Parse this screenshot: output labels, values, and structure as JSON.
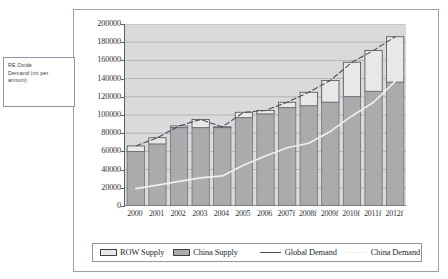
{
  "callout": {
    "name": "re-oxide-demand-label",
    "text": "RE Oxide\nDemand (mt per\nannum)"
  },
  "legend": {
    "items": [
      {
        "label": "ROW Supply",
        "marker": "swatch",
        "color": "#e8e8e8"
      },
      {
        "label": "China Supply",
        "marker": "swatch",
        "color": "#a9abad"
      },
      {
        "label": "Global Demand",
        "marker": "line",
        "color": "#4a4e52"
      },
      {
        "label": "China Demand",
        "marker": "line",
        "color": "#efefef"
      }
    ]
  },
  "chart_data": {
    "type": "bar",
    "stacked": true,
    "title": "",
    "subtitle": "",
    "xlabel": "",
    "ylabel": "RE Oxide Demand (mt per annum)",
    "ylim": [
      0,
      200000
    ],
    "ytick_step": 20000,
    "yticks": [
      200000,
      180000,
      160000,
      140000,
      120000,
      100000,
      80000,
      60000,
      40000,
      20000,
      0
    ],
    "ytick_labels": [
      "200000",
      "180000",
      "160000",
      "140000",
      "120000",
      "100000",
      "80000",
      "60000",
      "40000",
      "20000",
      "0"
    ],
    "grid": true,
    "grid_axis": "y",
    "legend_position": "bottom",
    "categories": [
      "2000",
      "2001",
      "2002",
      "2003",
      "2004",
      "2005",
      "2006",
      "2007f",
      "2008f",
      "2009f",
      "2010f",
      "2011f",
      "2012f"
    ],
    "series": [
      {
        "name": "China Supply",
        "type": "bar",
        "color": "#a9abad",
        "values": [
          60000,
          68000,
          86000,
          86000,
          86000,
          97000,
          101000,
          108000,
          110000,
          114000,
          120000,
          126000,
          136000
        ]
      },
      {
        "name": "ROW Supply",
        "type": "bar",
        "color": "#e8e8e8",
        "values": [
          6000,
          7000,
          2000,
          9000,
          1000,
          6000,
          4000,
          6000,
          15000,
          24000,
          38000,
          45000,
          50000
        ]
      },
      {
        "name": "Global Demand",
        "type": "line",
        "color": "#4a4e52",
        "values": [
          66000,
          75000,
          88000,
          95000,
          87000,
          103000,
          105000,
          114000,
          125000,
          138000,
          158000,
          171000,
          186000
        ]
      },
      {
        "name": "China Demand",
        "type": "line",
        "color": "#efefef",
        "values": [
          19000,
          23000,
          27000,
          31000,
          33000,
          45000,
          55000,
          64000,
          69000,
          82000,
          99000,
          114000,
          137000
        ]
      }
    ],
    "bar_totals": [
      66000,
      75000,
      88000,
      95000,
      87000,
      103000,
      105000,
      114000,
      125000,
      138000,
      158000,
      171000,
      186000
    ]
  },
  "colors": {
    "plot_background": "#d9dadb",
    "china_supply": "#a9abad",
    "row_supply": "#e8e8e8",
    "global_demand_line": "#4a4e52",
    "china_demand_line": "#efefef",
    "gridline": "#9a9c9e",
    "axis": "#5d6166",
    "frame": "#9aa3ad"
  }
}
